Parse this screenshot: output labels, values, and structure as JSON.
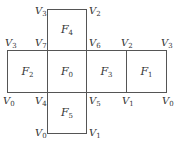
{
  "diagram": {
    "line_color": "#555555",
    "text_color": "#333333",
    "faces": [
      {
        "id": "F4",
        "letter": "F",
        "sub": "4",
        "x": 47,
        "y": 9,
        "w": 40,
        "h": 42
      },
      {
        "id": "F2",
        "letter": "F",
        "sub": "2",
        "x": 7,
        "y": 50,
        "w": 41,
        "h": 43
      },
      {
        "id": "F0",
        "letter": "F",
        "sub": "0",
        "x": 47,
        "y": 50,
        "w": 40,
        "h": 43
      },
      {
        "id": "F3",
        "letter": "F",
        "sub": "3",
        "x": 86,
        "y": 50,
        "w": 41,
        "h": 43
      },
      {
        "id": "F1",
        "letter": "F",
        "sub": "1",
        "x": 126,
        "y": 50,
        "w": 41,
        "h": 43
      },
      {
        "id": "F5",
        "letter": "F",
        "sub": "5",
        "x": 47,
        "y": 92,
        "w": 40,
        "h": 42
      }
    ],
    "vertices": [
      {
        "letter": "V",
        "sub": "3",
        "x": 35,
        "y": 6
      },
      {
        "letter": "V",
        "sub": "2",
        "x": 89,
        "y": 6
      },
      {
        "letter": "V",
        "sub": "3",
        "x": 5,
        "y": 38
      },
      {
        "letter": "V",
        "sub": "7",
        "x": 35,
        "y": 38
      },
      {
        "letter": "V",
        "sub": "6",
        "x": 89,
        "y": 38
      },
      {
        "letter": "V",
        "sub": "2",
        "x": 121,
        "y": 38
      },
      {
        "letter": "V",
        "sub": "3",
        "x": 161,
        "y": 38
      },
      {
        "letter": "V",
        "sub": "0",
        "x": 3,
        "y": 96
      },
      {
        "letter": "V",
        "sub": "4",
        "x": 35,
        "y": 96
      },
      {
        "letter": "V",
        "sub": "5",
        "x": 89,
        "y": 96
      },
      {
        "letter": "V",
        "sub": "1",
        "x": 122,
        "y": 96
      },
      {
        "letter": "V",
        "sub": "0",
        "x": 162,
        "y": 96
      },
      {
        "letter": "V",
        "sub": "0",
        "x": 35,
        "y": 128
      },
      {
        "letter": "V",
        "sub": "1",
        "x": 89,
        "y": 128
      }
    ]
  }
}
